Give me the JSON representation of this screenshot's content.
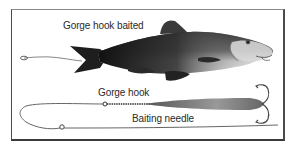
{
  "labels": {
    "baited": "Gorge hook baited",
    "hook": "Gorge hook",
    "needle": "Baiting needle"
  },
  "colors": {
    "ink": "#2a2a2a",
    "fish_dark": "#1e1e1e",
    "fish_light": "#d8d8d8",
    "background": "#ffffff"
  }
}
